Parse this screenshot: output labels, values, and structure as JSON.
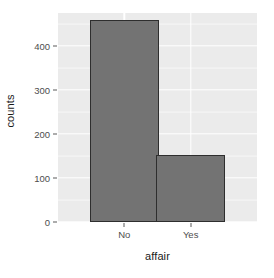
{
  "chart_data": {
    "type": "bar",
    "title": "",
    "subtitle": "",
    "xlabel": "affair",
    "ylabel": "counts",
    "categories": [
      "No",
      "Yes"
    ],
    "values": [
      460,
      152
    ],
    "series": [
      {
        "name": "counts",
        "values": [
          460,
          152
        ]
      }
    ],
    "ylim": [
      0,
      475
    ],
    "y_ticks": [
      0,
      100,
      200,
      300,
      400
    ],
    "y_tick_labels": [
      "0",
      "100",
      "200",
      "300",
      "400"
    ],
    "x_tick_labels": [
      "No",
      "Yes"
    ],
    "grid": true,
    "grid_minor": true,
    "legend": "none",
    "theme": "ggplot2-grey",
    "colors": {
      "bar_fill": "#737373",
      "bar_border": "#2e2e2e",
      "panel_background": "#ebebeb",
      "grid_major": "#ffffff",
      "grid_minor": "#f7f7f7",
      "plot_background": "#ffffff",
      "axis_text": "#4d4d4d",
      "axis_title": "#1a1a1a"
    }
  },
  "axes": {
    "y": {
      "title": "counts",
      "ticks": [
        {
          "label": "400",
          "value": 400
        },
        {
          "label": "300",
          "value": 300
        },
        {
          "label": "200",
          "value": 200
        },
        {
          "label": "100",
          "value": 100
        },
        {
          "label": "0",
          "value": 0
        }
      ]
    },
    "x": {
      "title": "affair",
      "ticks": [
        {
          "label": "No"
        },
        {
          "label": "Yes"
        }
      ]
    }
  }
}
